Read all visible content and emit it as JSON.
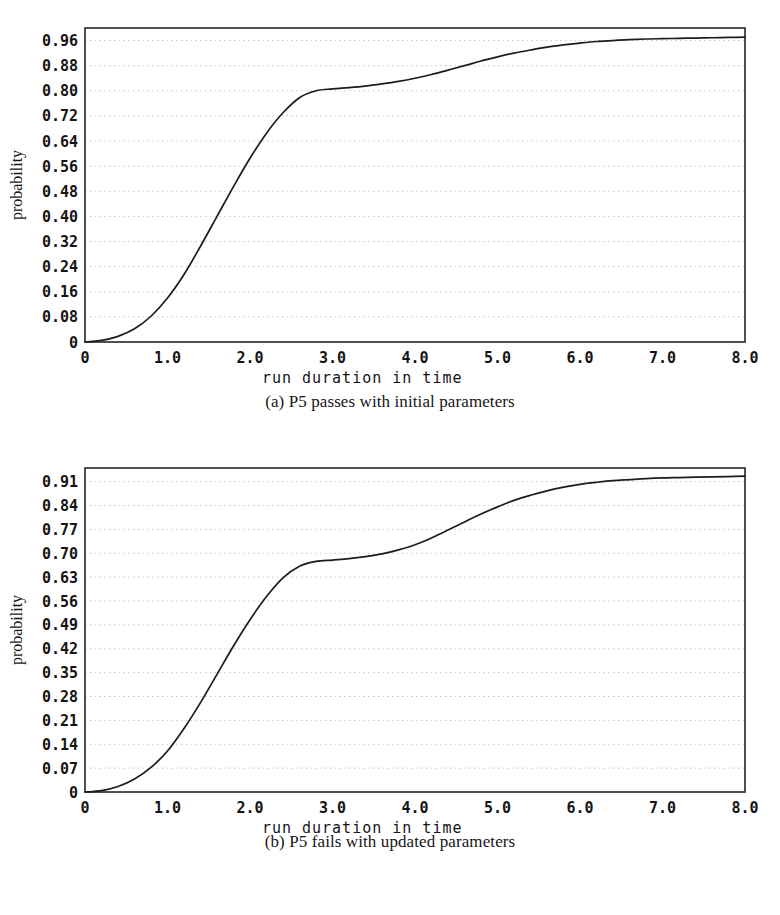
{
  "figure": {
    "panel_count": 2
  },
  "chart_data": [
    {
      "type": "line",
      "title": "",
      "caption": "(a) P5 passes with initial parameters",
      "xlabel": "run duration in time",
      "ylabel": "probability",
      "xlim": [
        0,
        8
      ],
      "ylim": [
        0,
        1.0
      ],
      "grid": true,
      "legend": "none",
      "xticks": [
        "0",
        "1.0",
        "2.0",
        "3.0",
        "4.0",
        "5.0",
        "6.0",
        "7.0",
        "8.0"
      ],
      "xtick_values": [
        0,
        1,
        2,
        3,
        4,
        5,
        6,
        7,
        8
      ],
      "yticks": [
        "0",
        "0.08",
        "0.16",
        "0.24",
        "0.32",
        "0.40",
        "0.48",
        "0.56",
        "0.64",
        "0.72",
        "0.80",
        "0.88",
        "0.96"
      ],
      "ytick_values": [
        0,
        0.08,
        0.16,
        0.24,
        0.32,
        0.4,
        0.48,
        0.56,
        0.64,
        0.72,
        0.8,
        0.88,
        0.96
      ],
      "series": [
        {
          "name": "cumulative probability",
          "x": [
            0.0,
            0.2,
            0.4,
            0.6,
            0.8,
            1.0,
            1.2,
            1.4,
            1.6,
            1.8,
            2.0,
            2.2,
            2.4,
            2.6,
            2.8,
            3.0,
            3.2,
            3.4,
            3.6,
            3.8,
            4.0,
            4.2,
            4.4,
            4.6,
            4.8,
            5.0,
            5.2,
            5.4,
            5.6,
            5.8,
            6.0,
            6.2,
            6.4,
            6.6,
            6.8,
            7.0,
            7.2,
            7.4,
            7.6,
            7.8,
            8.0
          ],
          "y": [
            0.0,
            0.005,
            0.018,
            0.042,
            0.082,
            0.14,
            0.215,
            0.305,
            0.4,
            0.495,
            0.585,
            0.665,
            0.73,
            0.778,
            0.8,
            0.806,
            0.81,
            0.815,
            0.822,
            0.83,
            0.84,
            0.852,
            0.866,
            0.88,
            0.895,
            0.908,
            0.92,
            0.93,
            0.939,
            0.946,
            0.952,
            0.957,
            0.96,
            0.963,
            0.965,
            0.966,
            0.967,
            0.968,
            0.969,
            0.97,
            0.971
          ]
        }
      ]
    },
    {
      "type": "line",
      "title": "",
      "caption": "(b) P5 fails with updated parameters",
      "xlabel": "run duration in time",
      "ylabel": "probability",
      "xlim": [
        0,
        8
      ],
      "ylim": [
        0,
        0.95
      ],
      "grid": true,
      "legend": "none",
      "xticks": [
        "0",
        "1.0",
        "2.0",
        "3.0",
        "4.0",
        "5.0",
        "6.0",
        "7.0",
        "8.0"
      ],
      "xtick_values": [
        0,
        1,
        2,
        3,
        4,
        5,
        6,
        7,
        8
      ],
      "yticks": [
        "0",
        "0.07",
        "0.14",
        "0.21",
        "0.28",
        "0.35",
        "0.42",
        "0.49",
        "0.56",
        "0.63",
        "0.70",
        "0.77",
        "0.84",
        "0.91"
      ],
      "ytick_values": [
        0,
        0.07,
        0.14,
        0.21,
        0.28,
        0.35,
        0.42,
        0.49,
        0.56,
        0.63,
        0.7,
        0.77,
        0.84,
        0.91
      ],
      "series": [
        {
          "name": "cumulative probability",
          "x": [
            0.0,
            0.2,
            0.4,
            0.6,
            0.8,
            1.0,
            1.2,
            1.4,
            1.6,
            1.8,
            2.0,
            2.2,
            2.4,
            2.6,
            2.8,
            3.0,
            3.2,
            3.4,
            3.6,
            3.8,
            4.0,
            4.2,
            4.4,
            4.6,
            4.8,
            5.0,
            5.2,
            5.4,
            5.6,
            5.8,
            6.0,
            6.2,
            6.4,
            6.6,
            6.8,
            7.0,
            7.2,
            7.4,
            7.6,
            7.8,
            8.0
          ],
          "y": [
            0.0,
            0.004,
            0.016,
            0.038,
            0.072,
            0.12,
            0.186,
            0.262,
            0.345,
            0.428,
            0.505,
            0.573,
            0.628,
            0.662,
            0.676,
            0.68,
            0.684,
            0.69,
            0.698,
            0.71,
            0.725,
            0.745,
            0.768,
            0.792,
            0.815,
            0.836,
            0.855,
            0.87,
            0.883,
            0.894,
            0.902,
            0.908,
            0.913,
            0.916,
            0.919,
            0.921,
            0.922,
            0.923,
            0.924,
            0.925,
            0.926
          ]
        }
      ]
    }
  ],
  "colors": {
    "curve": "#1c1c1c",
    "frame": "#262626",
    "grid": "#c9c9c9",
    "text": "#151515",
    "background": "#ffffff"
  }
}
